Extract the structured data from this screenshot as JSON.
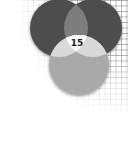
{
  "diagram": {
    "type": "venn",
    "sets": [
      {
        "id": "A",
        "position": "top-left",
        "color": "#4d4d4d"
      },
      {
        "id": "B",
        "position": "top-right",
        "color": "#4d4d4d"
      },
      {
        "id": "C",
        "position": "bottom",
        "color": "#a9a9a9"
      }
    ],
    "regions": {
      "ab_overlap_color": "#7d7d7d",
      "ac_overlap_color": "#d9d9d9",
      "bc_overlap_color": "#d9d9d9",
      "abc_center_color": "#ffffff"
    },
    "center_label": "15",
    "background": "grid"
  }
}
